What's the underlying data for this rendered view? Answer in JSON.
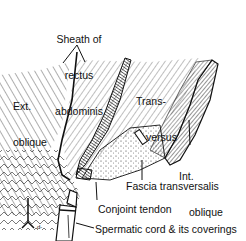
{
  "figure": {
    "type": "anatomical-illustration",
    "style": "black-and-white line drawing",
    "colors": {
      "ink": "#111111",
      "background": "#ffffff"
    }
  },
  "labels": {
    "sheath_line1": "Sheath of",
    "sheath_line2": "rectus",
    "sheath_line3": "abdominis",
    "ext_oblique_line1": "Ext.",
    "ext_oblique_line2": "oblique",
    "transversus_line1": "Trans-",
    "transversus_line2": "versus",
    "int_oblique_line1": "Int.",
    "int_oblique_line2": "oblique",
    "fascia_transversalis": "Fascia transversalis",
    "conjoint_tendon": "Conjoint tendon",
    "spermatic_cord": "Spermatic cord & its coverings"
  }
}
